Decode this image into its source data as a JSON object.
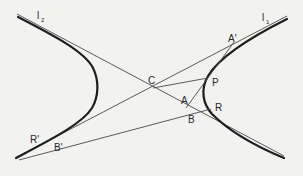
{
  "figure": {
    "asymptotes": [
      {
        "name": "l1",
        "label": "l",
        "subscript": "1"
      },
      {
        "name": "l2",
        "label": "l",
        "subscript": "2"
      }
    ],
    "points": {
      "C": "C",
      "A_prime": "A'",
      "P": "P",
      "A": "A",
      "B": "B",
      "R": "R",
      "B_prime": "B'",
      "R_prime": "R'"
    },
    "colors": {
      "background": "#f2f2f0",
      "curve": "#1e1e1e",
      "lines": "#4a4a4a",
      "text": "#2a2a2a"
    }
  }
}
